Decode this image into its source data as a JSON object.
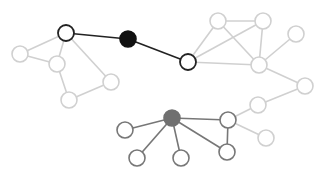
{
  "diagram": {
    "type": "network-graph",
    "width": 324,
    "height": 179,
    "colors": {
      "faded": "#d0d0d0",
      "bridge": "#222222",
      "mid": "#777777",
      "black_fill": "#111111",
      "gray_fill": "#707070",
      "white_fill": "#ffffff"
    },
    "node_radius": 8,
    "nodes": [
      {
        "id": "a1",
        "x": 66,
        "y": 33,
        "style": "bold"
      },
      {
        "id": "a2",
        "x": 20,
        "y": 54,
        "style": "faded"
      },
      {
        "id": "a3",
        "x": 57,
        "y": 64,
        "style": "faded"
      },
      {
        "id": "a4",
        "x": 69,
        "y": 100,
        "style": "faded"
      },
      {
        "id": "a5",
        "x": 111,
        "y": 82,
        "style": "faded"
      },
      {
        "id": "hub_black",
        "x": 128,
        "y": 39,
        "style": "black"
      },
      {
        "id": "b1",
        "x": 188,
        "y": 62,
        "style": "bold"
      },
      {
        "id": "b2",
        "x": 218,
        "y": 21,
        "style": "faded"
      },
      {
        "id": "b3",
        "x": 263,
        "y": 21,
        "style": "faded"
      },
      {
        "id": "b4",
        "x": 296,
        "y": 34,
        "style": "faded"
      },
      {
        "id": "b5",
        "x": 259,
        "y": 65,
        "style": "faded"
      },
      {
        "id": "b6",
        "x": 305,
        "y": 86,
        "style": "faded"
      },
      {
        "id": "b7",
        "x": 258,
        "y": 105,
        "style": "faded"
      },
      {
        "id": "c_hub",
        "x": 172,
        "y": 118,
        "style": "gray"
      },
      {
        "id": "c1",
        "x": 125,
        "y": 130,
        "style": "mid"
      },
      {
        "id": "c2",
        "x": 137,
        "y": 158,
        "style": "mid"
      },
      {
        "id": "c3",
        "x": 181,
        "y": 158,
        "style": "mid"
      },
      {
        "id": "c4",
        "x": 228,
        "y": 120,
        "style": "mid"
      },
      {
        "id": "c5",
        "x": 227,
        "y": 152,
        "style": "mid"
      },
      {
        "id": "c6",
        "x": 266,
        "y": 138,
        "style": "faded"
      }
    ],
    "edges": [
      {
        "from": "a1",
        "to": "hub_black",
        "style": "bridge"
      },
      {
        "from": "hub_black",
        "to": "b1",
        "style": "bridge"
      },
      {
        "from": "a1",
        "to": "a2",
        "style": "faded"
      },
      {
        "from": "a1",
        "to": "a3",
        "style": "faded"
      },
      {
        "from": "a1",
        "to": "a5",
        "style": "faded"
      },
      {
        "from": "a2",
        "to": "a3",
        "style": "faded"
      },
      {
        "from": "a3",
        "to": "a4",
        "style": "faded"
      },
      {
        "from": "a4",
        "to": "a5",
        "style": "faded"
      },
      {
        "from": "b1",
        "to": "b2",
        "style": "faded"
      },
      {
        "from": "b1",
        "to": "b3",
        "style": "faded"
      },
      {
        "from": "b1",
        "to": "b5",
        "style": "faded"
      },
      {
        "from": "b2",
        "to": "b3",
        "style": "faded"
      },
      {
        "from": "b2",
        "to": "b5",
        "style": "faded"
      },
      {
        "from": "b3",
        "to": "b5",
        "style": "faded"
      },
      {
        "from": "b4",
        "to": "b5",
        "style": "faded"
      },
      {
        "from": "b5",
        "to": "b6",
        "style": "faded"
      },
      {
        "from": "b6",
        "to": "b7",
        "style": "faded"
      },
      {
        "from": "b7",
        "to": "c4",
        "style": "faded"
      },
      {
        "from": "c4",
        "to": "c6",
        "style": "faded"
      },
      {
        "from": "c_hub",
        "to": "c1",
        "style": "mid"
      },
      {
        "from": "c_hub",
        "to": "c2",
        "style": "mid"
      },
      {
        "from": "c_hub",
        "to": "c3",
        "style": "mid"
      },
      {
        "from": "c_hub",
        "to": "c4",
        "style": "mid"
      },
      {
        "from": "c_hub",
        "to": "c5",
        "style": "mid"
      },
      {
        "from": "c4",
        "to": "c5",
        "style": "mid"
      }
    ]
  }
}
